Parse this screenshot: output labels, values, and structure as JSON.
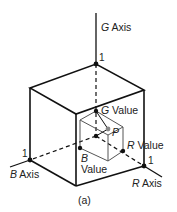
{
  "diagram": {
    "caption": "(a)",
    "axes": {
      "g": {
        "letter": "G",
        "word": "Axis",
        "tick": "1"
      },
      "b": {
        "letter": "B",
        "word": "Axis",
        "tick": "1"
      },
      "r": {
        "letter": "R",
        "word": "Axis",
        "tick": "1"
      }
    },
    "values": {
      "g": {
        "letter": "G",
        "word": "Value"
      },
      "b": {
        "letter": "B",
        "word": "Value"
      },
      "r": {
        "letter": "R",
        "word": "Value"
      }
    },
    "point": {
      "label": "P"
    },
    "colors": {
      "line": "#111111",
      "inner_line": "#666666",
      "point_p": "#888888"
    }
  }
}
